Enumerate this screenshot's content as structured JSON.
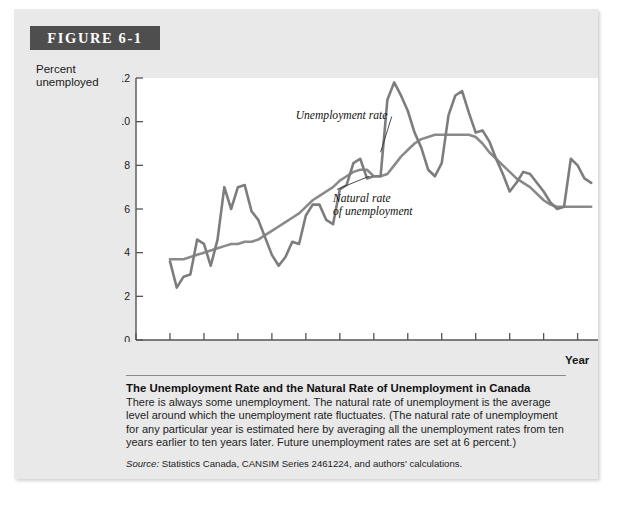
{
  "figure": {
    "banner_label": "FIGURE 6-1",
    "y_axis_title_line1": "Percent",
    "y_axis_title_line2": "unemployed",
    "x_axis_title": "Year"
  },
  "caption": {
    "title": "The Unemployment Rate and the Natural Rate of Unemployment in Canada",
    "body": "There is always some unemployment. The natural rate of unemployment is the average level around which the unemployment rate fluctuates. (The natural rate of unemployment for any particular year is estimated here by averaging all the unemployment rates from ten years earlier to ten years later. Future unemployment rates are set at 6 percent.)",
    "source_word": "Source:",
    "source_text": " Statistics Canada, CANSIM Series 2461224, and authors' calculations."
  },
  "colors": {
    "card_background": "#e9e9e9",
    "banner_background": "#4e4e4e",
    "banner_text": "#ffffff",
    "plot_background": "#ffffff",
    "axis": "#555555",
    "unemployment_rate_line": "#7d7d7d",
    "natural_rate_line": "#8a8a8a",
    "text": "#1a1a1a"
  },
  "chart_data": {
    "type": "line",
    "title": "The Unemployment Rate and the Natural Rate of Unemployment in Canada",
    "xlabel": "Year",
    "ylabel": "Percent unemployed",
    "xlim": [
      1945,
      2013
    ],
    "ylim": [
      0,
      12
    ],
    "yticks": [
      0,
      2,
      4,
      6,
      8,
      10,
      12
    ],
    "xticks": [
      1945,
      1950,
      1955,
      1960,
      1965,
      1970,
      1975,
      1980,
      1985,
      1990,
      1995,
      2000,
      2005,
      2010
    ],
    "grid": false,
    "legend": "annotations-inline",
    "annotations": [
      {
        "label": "Unemployment rate",
        "text_x": 1968.5,
        "text_y": 10.1,
        "point_x": 1981.0,
        "point_y": 8.6
      },
      {
        "label": "Natural rate",
        "label2": "of unemployment",
        "text_x": 1974.0,
        "text_y": 6.3,
        "point_x": 1979.3,
        "point_y": 7.5
      }
    ],
    "series": [
      {
        "name": "Unemployment rate",
        "x": [
          1950,
          1951,
          1952,
          1953,
          1954,
          1955,
          1956,
          1957,
          1958,
          1959,
          1960,
          1961,
          1962,
          1963,
          1964,
          1965,
          1966,
          1967,
          1968,
          1969,
          1970,
          1971,
          1972,
          1973,
          1974,
          1975,
          1976,
          1977,
          1978,
          1979,
          1980,
          1981,
          1982,
          1983,
          1984,
          1985,
          1986,
          1987,
          1988,
          1989,
          1990,
          1991,
          1992,
          1993,
          1994,
          1995,
          1996,
          1997,
          1998,
          1999,
          2000,
          2001,
          2002,
          2003,
          2004,
          2005,
          2006,
          2007,
          2008,
          2009,
          2010,
          2011,
          2012
        ],
        "values": [
          3.6,
          2.4,
          2.9,
          3.0,
          4.6,
          4.4,
          3.4,
          4.6,
          7.0,
          6.0,
          7.0,
          7.1,
          5.9,
          5.5,
          4.7,
          3.9,
          3.4,
          3.8,
          4.5,
          4.4,
          5.7,
          6.2,
          6.2,
          5.5,
          5.3,
          6.9,
          7.1,
          8.1,
          8.3,
          7.4,
          7.5,
          7.5,
          11.0,
          11.8,
          11.2,
          10.5,
          9.5,
          8.8,
          7.8,
          7.5,
          8.1,
          10.3,
          11.2,
          11.4,
          10.4,
          9.5,
          9.6,
          9.1,
          8.3,
          7.6,
          6.8,
          7.2,
          7.7,
          7.6,
          7.2,
          6.8,
          6.3,
          6.0,
          6.1,
          8.3,
          8.0,
          7.4,
          7.2
        ]
      },
      {
        "name": "Natural rate of unemployment",
        "x": [
          1950,
          1951,
          1952,
          1953,
          1954,
          1955,
          1956,
          1957,
          1958,
          1959,
          1960,
          1961,
          1962,
          1963,
          1964,
          1965,
          1966,
          1967,
          1968,
          1969,
          1970,
          1971,
          1972,
          1973,
          1974,
          1975,
          1976,
          1977,
          1978,
          1979,
          1980,
          1981,
          1982,
          1983,
          1984,
          1985,
          1986,
          1987,
          1988,
          1989,
          1990,
          1991,
          1992,
          1993,
          1994,
          1995,
          1996,
          1997,
          1998,
          1999,
          2000,
          2001,
          2002,
          2003,
          2004,
          2005,
          2006,
          2007,
          2008,
          2009,
          2010,
          2011,
          2012
        ],
        "values": [
          3.7,
          3.7,
          3.7,
          3.8,
          3.9,
          4.0,
          4.1,
          4.2,
          4.3,
          4.4,
          4.4,
          4.5,
          4.5,
          4.6,
          4.8,
          5.0,
          5.2,
          5.4,
          5.6,
          5.8,
          6.1,
          6.4,
          6.6,
          6.8,
          7.0,
          7.3,
          7.5,
          7.7,
          7.8,
          7.8,
          7.5,
          7.5,
          7.6,
          8.0,
          8.4,
          8.7,
          9.0,
          9.2,
          9.3,
          9.4,
          9.4,
          9.4,
          9.4,
          9.4,
          9.4,
          9.3,
          9.0,
          8.6,
          8.3,
          8.0,
          7.7,
          7.4,
          7.2,
          7.0,
          6.7,
          6.4,
          6.2,
          6.1,
          6.1,
          6.1,
          6.1,
          6.1,
          6.1
        ]
      }
    ]
  }
}
